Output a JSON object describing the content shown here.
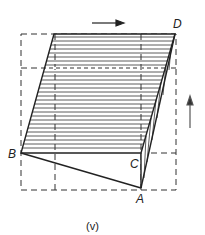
{
  "figure": {
    "caption": "(v)",
    "labels": {
      "A": "A",
      "B": "B",
      "C": "C",
      "D": "D"
    },
    "arrows": [
      {
        "name": "shear-arrow-top",
        "direction": "right"
      },
      {
        "name": "shear-arrow-side",
        "direction": "up"
      }
    ],
    "colors": {
      "line": "#222222",
      "background": "#ffffff"
    }
  }
}
